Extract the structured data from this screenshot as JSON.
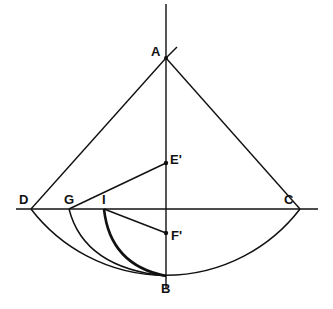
{
  "diagram": {
    "type": "geometric-construction",
    "colors": {
      "line": "#111111",
      "background": "#ffffff"
    },
    "points": {
      "A": {
        "label": "A",
        "x": 166,
        "y": 58
      },
      "B": {
        "label": "B",
        "x": 166,
        "y": 276
      },
      "C": {
        "label": "C",
        "x": 300,
        "y": 209
      },
      "D": {
        "label": "D",
        "x": 31,
        "y": 209
      },
      "E": {
        "label": "E'",
        "x": 166,
        "y": 163
      },
      "F": {
        "label": "F'",
        "x": 166,
        "y": 233
      },
      "G": {
        "label": "G",
        "x": 69,
        "y": 209
      },
      "I": {
        "label": "I",
        "x": 104,
        "y": 209
      }
    },
    "segments": [
      "A-D",
      "A-C",
      "G-E'",
      "I-F'",
      "D-C (extended)",
      "vertical axis through A and B"
    ],
    "arcs": [
      "D-B-C",
      "G-B",
      "I-B (bold)"
    ]
  }
}
